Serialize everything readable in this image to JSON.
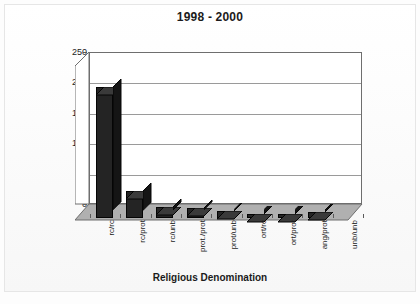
{
  "chart_data": {
    "type": "bar",
    "title": "1998 - 2000",
    "xlabel": "Religious Denomination",
    "ylabel": "",
    "categories": [
      "rc/rc",
      "rc/prot",
      "rc/unb",
      "prot./prot",
      "prot/unb",
      "ort/rc",
      "ort/prot",
      "ang/prot",
      "unb/unb"
    ],
    "values": [
      215,
      45,
      18,
      16,
      11,
      6,
      6,
      10,
      0
    ],
    "ylim": [
      0,
      250
    ],
    "yticks": [
      0,
      50,
      100,
      150,
      200,
      250
    ],
    "ytick_labels": [
      "0",
      "50",
      "100",
      "150",
      "200",
      "250"
    ],
    "grid": true,
    "legend": false,
    "style": "3d-column",
    "bar_color": "#242424",
    "floor_color": "#b0b0b0",
    "gridline_color": "#9a9a9a"
  },
  "chart": {
    "title": "1998 - 2000",
    "xaxis_title": "Religious Denomination"
  }
}
